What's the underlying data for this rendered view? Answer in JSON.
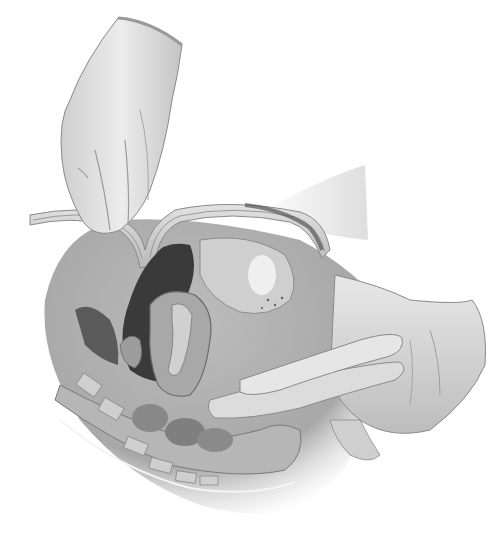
{
  "image": {
    "kind": "medical-illustration",
    "subject": "bimanual pelvic examination, sagittal cross-section",
    "style": "grayscale pencil/airbrush illustration",
    "background": "#ffffff",
    "palette": {
      "skin_light": "#e6e6e6",
      "skin_mid": "#c8c8c8",
      "skin_shadow": "#9a9a9a",
      "tissue_mid": "#b4b4b4",
      "tissue_dark": "#6e6e6e",
      "cavity_dark": "#2e2e2e",
      "outline": "#7a7a7a"
    },
    "elements": [
      "abdominal-hand",
      "abdominal-wall",
      "pelvic-cavity",
      "uterus",
      "bladder",
      "vaginal-examining-fingers",
      "examining-hand-palm",
      "rectum-sigmoid",
      "sacrum-coccyx"
    ]
  }
}
